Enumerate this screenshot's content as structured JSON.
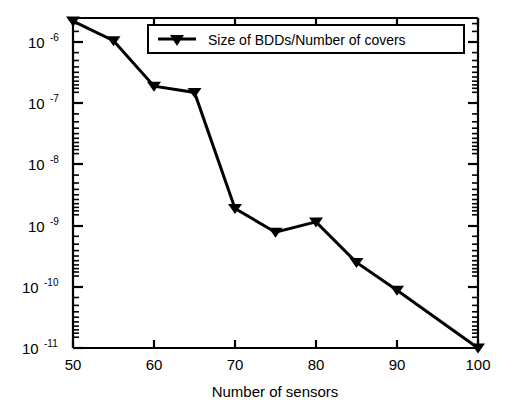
{
  "chart_data": {
    "type": "line",
    "title": "",
    "xlabel": "Number of sensors",
    "ylabel": "",
    "xlim": [
      50,
      100
    ],
    "ylim": [
      1e-11,
      2.5e-06
    ],
    "yscale": "log",
    "xscale": "linear",
    "grid": false,
    "legend_position": "top-center",
    "x_ticks": [
      50,
      60,
      70,
      80,
      90,
      100
    ],
    "x_tick_labels": [
      "50",
      "60",
      "70",
      "80",
      "90",
      "100"
    ],
    "y_ticks": [
      1e-06,
      1e-07,
      1e-08,
      1e-09,
      1e-10,
      1e-11
    ],
    "y_tick_labels": [
      {
        "mantissa": "10",
        "exponent": "-6"
      },
      {
        "mantissa": "10",
        "exponent": "-7"
      },
      {
        "mantissa": "10",
        "exponent": "-8"
      },
      {
        "mantissa": "10",
        "exponent": "-9"
      },
      {
        "mantissa": "10",
        "exponent": "-10"
      },
      {
        "mantissa": "10",
        "exponent": "-11"
      }
    ],
    "series": [
      {
        "name": "Size of BDDs/Number of covers",
        "marker": "triangle-down",
        "color": "#000000",
        "linewidth": 3,
        "x": [
          50,
          55,
          60,
          65,
          70,
          75,
          80,
          85,
          90,
          100
        ],
        "values": [
          2.2e-06,
          1.05e-06,
          1.9e-07,
          1.5e-07,
          1.9e-09,
          7.8e-10,
          1.15e-09,
          2.5e-10,
          8.8e-11,
          1e-11
        ]
      }
    ],
    "legend_entries": [
      {
        "label": "Size of BDDs/Number of covers",
        "marker": "triangle-down",
        "color": "#000000"
      }
    ]
  },
  "figure": {
    "background_color": "#ffffff",
    "axis_color": "#000000"
  }
}
